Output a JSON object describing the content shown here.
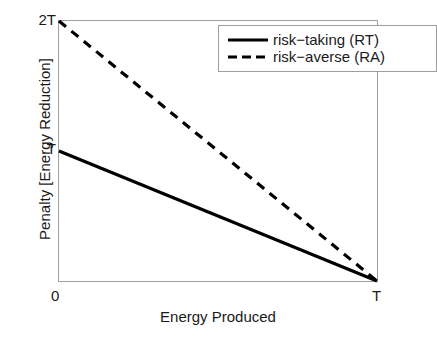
{
  "chart_data": {
    "type": "line",
    "title": "",
    "xlabel": "Energy Produced",
    "ylabel": "Penalty [Energy Reduction]",
    "xlim": [
      0,
      1
    ],
    "ylim": [
      0,
      2
    ],
    "xticks": [
      "0",
      "T"
    ],
    "yticks": [
      "0",
      "T",
      "2T"
    ],
    "xtick_values": [
      0,
      1
    ],
    "ytick_values": [
      0,
      1,
      2
    ],
    "grid": false,
    "legend_position": "upper right",
    "series": [
      {
        "name": "risk−taking (RT)",
        "style": "solid",
        "color": "#000000",
        "linewidth": 3,
        "x": [
          0,
          1
        ],
        "y": [
          1,
          0
        ]
      },
      {
        "name": "risk−averse (RA)",
        "style": "dashed",
        "color": "#000000",
        "linewidth": 3,
        "x": [
          0,
          1
        ],
        "y": [
          2,
          0
        ]
      }
    ]
  },
  "axes": {
    "ylabel": "Penalty [Energy Reduction]",
    "xlabel": "Energy Produced",
    "ytick_top": "2T",
    "ytick_mid": "T",
    "xtick_left": "0",
    "xtick_right": "T",
    "frame_color": "#9e9e9e"
  },
  "legend": {
    "items": [
      {
        "label": "risk−taking (RT)",
        "style": "solid"
      },
      {
        "label": "risk−averse (RA)",
        "style": "dashed"
      }
    ]
  },
  "colors": {
    "line": "#000000",
    "axis": "#9e9e9e",
    "text": "#1a1a1a",
    "background": "#ffffff"
  }
}
